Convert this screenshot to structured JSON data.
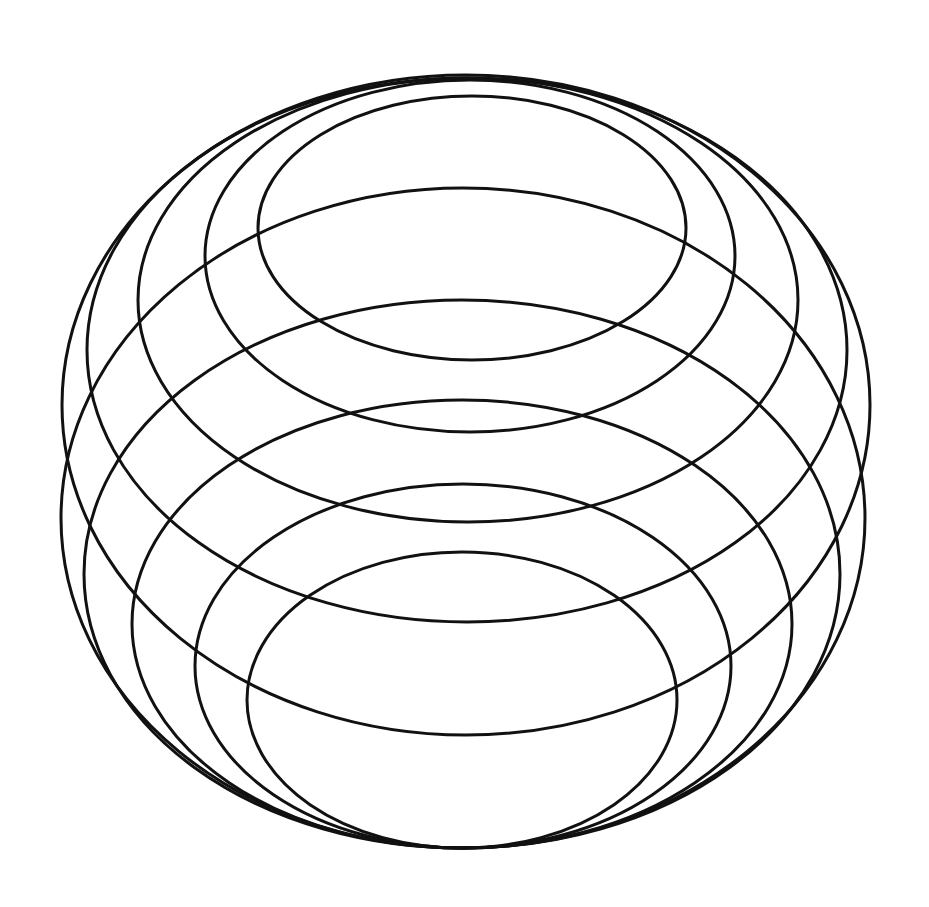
{
  "figure": {
    "stroke_color": "#111111",
    "background_color": "#ffffff",
    "top_family": [
      {
        "cx": 472,
        "cy": 228,
        "rx": 214,
        "ry": 132
      },
      {
        "cx": 470,
        "cy": 256,
        "rx": 265,
        "ry": 176
      },
      {
        "cx": 468,
        "cy": 300,
        "rx": 330,
        "ry": 222
      },
      {
        "cx": 467,
        "cy": 350,
        "rx": 380,
        "ry": 272
      },
      {
        "cx": 466,
        "cy": 405,
        "rx": 404,
        "ry": 330
      }
    ],
    "bottom_family": [
      {
        "cx": 462,
        "cy": 700,
        "rx": 215,
        "ry": 148
      },
      {
        "cx": 463,
        "cy": 666,
        "rx": 268,
        "ry": 182
      },
      {
        "cx": 462,
        "cy": 624,
        "rx": 330,
        "ry": 224
      },
      {
        "cx": 462,
        "cy": 574,
        "rx": 378,
        "ry": 274
      },
      {
        "cx": 463,
        "cy": 518,
        "rx": 402,
        "ry": 330
      }
    ]
  }
}
